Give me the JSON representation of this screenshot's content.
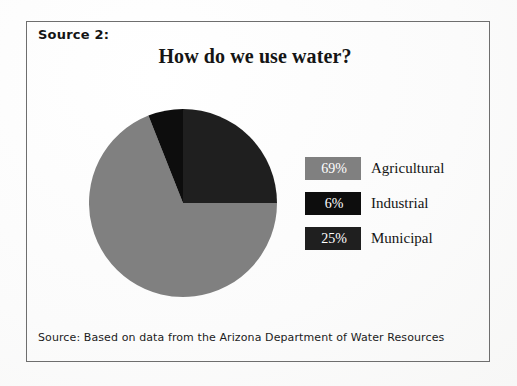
{
  "figure": {
    "source_label": "Source 2:",
    "title": "How do we use water?",
    "footer_note": "Source: Based on data from the Arizona Department of Water Resources"
  },
  "colors": {
    "agricultural": "#808080",
    "industrial": "#0d0d0d",
    "municipal": "#1f1f1f",
    "page_background": "#fbfbfb",
    "frame_border": "#6e6e6e",
    "text": "#141414",
    "swatch_text": "#ffffff"
  },
  "legend": {
    "items": [
      {
        "percent": "69%",
        "label": "Agricultural",
        "swatch": "#808080"
      },
      {
        "percent": "6%",
        "label": "Industrial",
        "swatch": "#0d0d0d"
      },
      {
        "percent": "25%",
        "label": "Municipal",
        "swatch": "#1f1f1f"
      }
    ]
  },
  "chart_data": {
    "type": "pie",
    "title": "How do we use water?",
    "categories": [
      "Municipal",
      "Agricultural",
      "Industrial"
    ],
    "values": [
      25,
      69,
      6
    ],
    "unit": "percent",
    "total": 100,
    "start_angle_deg": 0,
    "direction": "clockwise",
    "slices": [
      {
        "name": "Municipal",
        "value": 25,
        "label": "25%",
        "color": "#1f1f1f",
        "start_deg": 0,
        "end_deg": 90
      },
      {
        "name": "Agricultural",
        "value": 69,
        "label": "69%",
        "color": "#808080",
        "start_deg": 90,
        "end_deg": 338.4
      },
      {
        "name": "Industrial",
        "value": 6,
        "label": "6%",
        "color": "#0d0d0d",
        "start_deg": 338.4,
        "end_deg": 360
      }
    ],
    "legend_position": "right",
    "grid": false,
    "xlabel": "",
    "ylabel": ""
  }
}
